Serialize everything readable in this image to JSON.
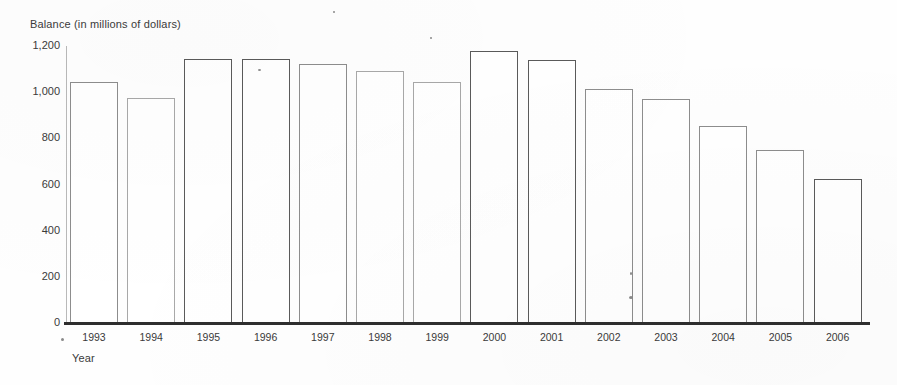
{
  "chart_data": {
    "type": "bar",
    "title": "",
    "ylabel": "Balance (in millions of dollars)",
    "xlabel": "Year",
    "categories": [
      "1993",
      "1994",
      "1995",
      "1996",
      "1997",
      "1998",
      "1999",
      "2000",
      "2001",
      "2002",
      "2003",
      "2004",
      "2005",
      "2006"
    ],
    "values": [
      1044,
      975,
      1144,
      1144,
      1122,
      1092,
      1044,
      1180,
      1140,
      1014,
      971,
      853,
      750,
      624
    ],
    "ylim": [
      0,
      1200
    ],
    "ytick_labels": [
      "0",
      "200",
      "400",
      "600",
      "800",
      "1,000",
      "1,200"
    ],
    "ytick_values": [
      0,
      200,
      400,
      600,
      800,
      1000,
      1200
    ],
    "grid": false,
    "legend": null,
    "bar_style": "outline",
    "colors": {
      "bar_outline": "#8d8d8d",
      "axis": "#2e2e2e",
      "text": "#3a3a3a",
      "background": "#ffffff"
    }
  }
}
